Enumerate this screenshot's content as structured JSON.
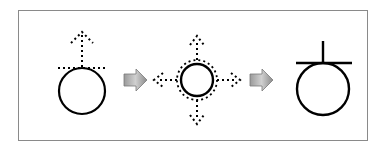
{
  "diagram": {
    "title": "",
    "steps": [
      {
        "id": "step-1",
        "description": "circle with dotted tangent line and dotted upward arrow"
      },
      {
        "id": "step-2",
        "description": "circle with dotted outline and dotted arrows in four directions"
      },
      {
        "id": "step-3",
        "description": "circle with solid tangent line and solid vertical stem"
      }
    ],
    "connectors": [
      {
        "from": "step-1",
        "to": "step-2",
        "icon": "arrow-right-icon"
      },
      {
        "from": "step-2",
        "to": "step-3",
        "icon": "arrow-right-icon"
      }
    ],
    "colors": {
      "stroke": "#000000",
      "frame": "#8a8a8a",
      "arrow_light": "#d8d8d8",
      "arrow_dark": "#7a7a7a"
    }
  }
}
